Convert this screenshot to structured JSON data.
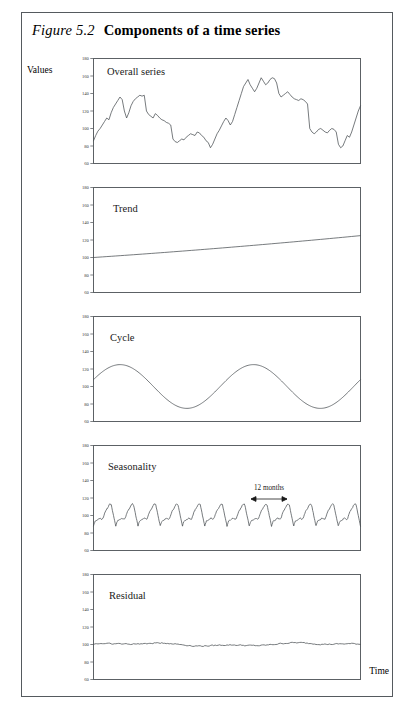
{
  "figure": {
    "number": "Figure 5.2",
    "caption": "Components of a time series",
    "y_axis_label": "Values",
    "x_axis_label": "Time"
  },
  "axis": {
    "ticks": [
      "180",
      "160",
      "140",
      "120",
      "100",
      "80",
      "60"
    ],
    "ymin": 60,
    "ymax": 180
  },
  "annotation": {
    "seasonality_span_label": "12 months"
  },
  "panels": [
    {
      "label": "Overall series"
    },
    {
      "label": "Trend"
    },
    {
      "label": "Cycle"
    },
    {
      "label": "Seasonality"
    },
    {
      "label": "Residual"
    }
  ],
  "chart_data": {
    "type": "line",
    "title": "Components of a time series",
    "xlabel": "Time",
    "ylabel": "Values",
    "ylim": [
      60,
      180
    ],
    "yticks": [
      180,
      160,
      140,
      120,
      100,
      80,
      60
    ],
    "grid": false,
    "legend": "none",
    "x_units": "months",
    "n_points": 120,
    "annotations": [
      {
        "panel": "Seasonality",
        "text": "12 months",
        "type": "double-arrow-span",
        "x_start": 0.66,
        "x_end": 0.78
      }
    ],
    "series": [
      {
        "name": "Overall series",
        "panel": 0,
        "description": "Irregular fluctuating series combining trend, cycle, seasonality and residual; rises from ~85 to peaks near 160 mid-right, with troughs near 75.",
        "values": [
          86,
          92,
          97,
          100,
          104,
          108,
          112,
          110,
          118,
          124,
          128,
          132,
          136,
          133,
          120,
          112,
          118,
          126,
          131,
          134,
          136,
          138,
          137,
          138,
          120,
          116,
          114,
          112,
          117,
          115,
          112,
          110,
          109,
          107,
          106,
          104,
          88,
          85,
          84,
          86,
          88,
          87,
          90,
          92,
          94,
          93,
          92,
          96,
          95,
          92,
          90,
          86,
          84,
          78,
          82,
          88,
          94,
          98,
          103,
          108,
          112,
          109,
          104,
          108,
          116,
          124,
          132,
          140,
          148,
          152,
          156,
          150,
          146,
          142,
          146,
          152,
          158,
          154,
          150,
          152,
          156,
          158,
          157,
          152,
          140,
          136,
          138,
          140,
          142,
          139,
          136,
          134,
          133,
          132,
          134,
          133,
          131,
          128,
          100,
          96,
          94,
          96,
          99,
          100,
          98,
          96,
          95,
          98,
          100,
          99,
          96,
          82,
          78,
          80,
          86,
          92,
          90,
          96,
          104,
          112,
          120,
          126
        ]
      },
      {
        "name": "Trend",
        "panel": 1,
        "description": "Smooth gently increasing, slightly convex line.",
        "values": [
          100,
          125
        ],
        "start_value": 100,
        "end_value": 125
      },
      {
        "name": "Cycle",
        "panel": 2,
        "description": "Smooth sinusoid, two complete periods, amplitude ~25 about a mean of 100.",
        "mean": 100,
        "amplitude": 25,
        "periods": 2,
        "min": 75,
        "max": 125
      },
      {
        "name": "Seasonality",
        "panel": 3,
        "description": "Repeating sawtooth, 12 cycles (one per year of 12 months), gradual rise then sharp drop, range ~88 to ~112.",
        "cycles": 12,
        "min": 88,
        "max": 112,
        "mean": 100
      },
      {
        "name": "Residual",
        "panel": 4,
        "description": "Near-flat low-amplitude random noise centred on 100.",
        "mean": 100,
        "amplitude": 2.5
      }
    ]
  }
}
